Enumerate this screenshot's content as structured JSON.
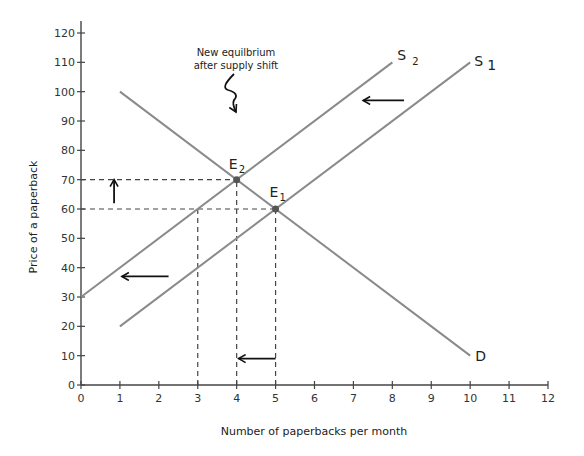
{
  "chart_data": {
    "type": "line",
    "title": "",
    "xlabel": "Number of paperbacks per month",
    "ylabel": "Price of a paperback",
    "xlim": [
      0,
      12
    ],
    "ylim": [
      0,
      120
    ],
    "x_ticks": [
      0,
      1,
      2,
      3,
      4,
      5,
      6,
      7,
      8,
      9,
      10,
      11,
      12
    ],
    "y_ticks": [
      0,
      10,
      20,
      30,
      40,
      50,
      60,
      70,
      80,
      90,
      100,
      110,
      120
    ],
    "grid": false,
    "legend": null,
    "series": [
      {
        "name": "D",
        "points": [
          [
            1,
            100
          ],
          [
            10,
            10
          ]
        ],
        "color": "#8a8a8a"
      },
      {
        "name": "S1",
        "label_main": "S",
        "label_sub": "1",
        "points": [
          [
            1,
            20
          ],
          [
            10,
            110
          ]
        ],
        "color": "#8a8a8a"
      },
      {
        "name": "S2",
        "label_main": "S",
        "label_sub": "2",
        "points": [
          [
            0,
            30
          ],
          [
            8,
            110
          ]
        ],
        "color": "#8a8a8a"
      }
    ],
    "equilibria": [
      {
        "name": "E1",
        "label_main": "E",
        "label_sub": "1",
        "x": 5,
        "y": 60
      },
      {
        "name": "E2",
        "label_main": "E",
        "label_sub": "2",
        "x": 4,
        "y": 70
      }
    ],
    "guide_lines": [
      {
        "type": "horizontal",
        "y": 70,
        "x_to": 4
      },
      {
        "type": "horizontal",
        "y": 60,
        "x_to": 5
      },
      {
        "type": "vertical",
        "x": 3,
        "y_to": 60
      },
      {
        "type": "vertical",
        "x": 4,
        "y_to": 70
      },
      {
        "type": "vertical",
        "x": 5,
        "y_to": 60
      }
    ],
    "arrows": [
      {
        "name": "price-up-arrow",
        "from": [
          0.85,
          62
        ],
        "to": [
          0.85,
          70
        ],
        "direction": "up"
      },
      {
        "name": "quantity-left-arrow",
        "from": [
          5,
          9
        ],
        "to": [
          4.05,
          9
        ],
        "direction": "left"
      },
      {
        "name": "supply-shift-arrow-lower",
        "from": [
          2.25,
          37
        ],
        "to": [
          1.05,
          37
        ],
        "direction": "left"
      },
      {
        "name": "supply-shift-arrow-upper",
        "from": [
          8.3,
          97
        ],
        "to": [
          7.25,
          97
        ],
        "direction": "left"
      }
    ],
    "annotations": [
      {
        "text_line1": "New equilbrium",
        "text_line2": "after supply shift",
        "points_to": "E2"
      }
    ]
  }
}
